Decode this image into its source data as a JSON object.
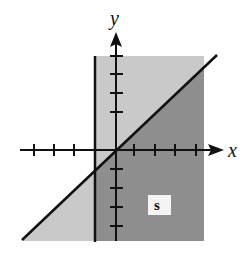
{
  "diagram": {
    "type": "inequality-region-graph",
    "axes": {
      "x_label": "x",
      "y_label": "y",
      "x_ticks": [
        -4,
        -3,
        -2,
        -1,
        1,
        2,
        3,
        4
      ],
      "y_ticks": [
        -4,
        -3,
        -2,
        -1,
        1,
        2,
        3,
        4
      ]
    },
    "region_label": "S",
    "region_label_text": "s",
    "boundaries": [
      {
        "name": "vertical-line",
        "equation": "x = -1"
      },
      {
        "name": "diagonal-line",
        "equation": "y = x"
      }
    ],
    "colors": {
      "light_shade": "#c8c8c8",
      "dark_shade": "#8c8c8c",
      "lines": "#111111",
      "background": "#ffffff",
      "label_box": "#f4f4f4"
    }
  }
}
